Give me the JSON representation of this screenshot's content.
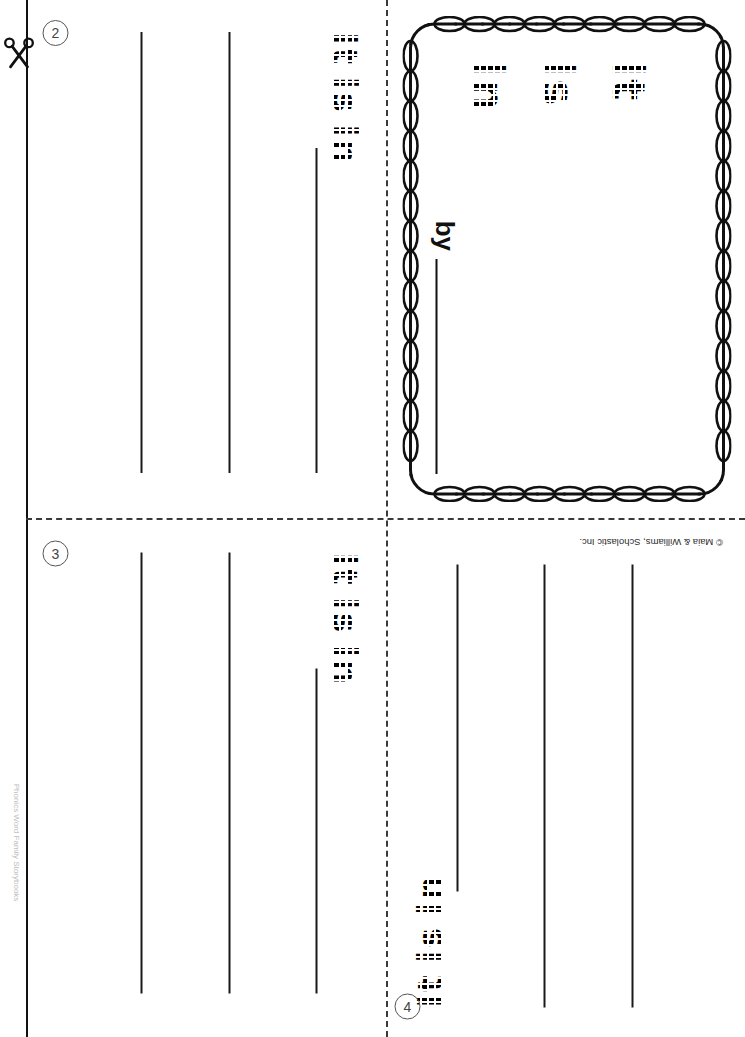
{
  "document": {
    "type": "printable-mini-book-worksheet",
    "orientation": "landscape-rotated",
    "publisher_credit": "© Maia & Williams, Scholastic Inc.",
    "margin_credit": "Phonics Word Family Storybooks"
  },
  "cover": {
    "title_lines": [
      "It",
      "Is",
      "In"
    ],
    "title_full": "It Is In",
    "byline_label": "by",
    "byline_value": "",
    "border_style": "chain-loop"
  },
  "pages": [
    {
      "number": "2",
      "sentence_words": [
        "It",
        "is",
        "in"
      ],
      "sentence_full": "It is in",
      "writing_lines": 3
    },
    {
      "number": "3",
      "sentence_words": [
        "It",
        "is",
        "in"
      ],
      "sentence_full": "It is in",
      "writing_lines": 3
    },
    {
      "number": "4",
      "sentence_words": [
        "It",
        "is",
        "in"
      ],
      "sentence_full": "It is in",
      "writing_lines": 3
    }
  ],
  "guides": {
    "cut_icon": "scissors-icon",
    "fold_vertical": "dashed",
    "fold_horizontal": "dashed",
    "trim_edge": "solid"
  }
}
